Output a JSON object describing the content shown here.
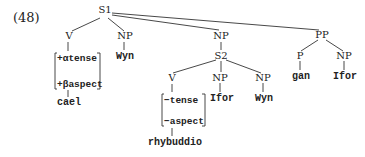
{
  "example_number": "(48)",
  "tree": {
    "root": "S1",
    "s1_children": {
      "v": {
        "label": "V",
        "features": [
          "+αtense",
          "+βaspect"
        ],
        "word": "cael"
      },
      "np1": {
        "label": "NP",
        "word": "Wyn"
      },
      "np2": {
        "label": "NP",
        "s2": {
          "label": "S2",
          "v": {
            "label": "V",
            "features": [
              "−tense",
              "−aspect"
            ],
            "word": "rhybuddio"
          },
          "np_a": {
            "label": "NP",
            "word": "Ifor"
          },
          "np_b": {
            "label": "NP",
            "word": "Wyn"
          }
        }
      },
      "pp": {
        "label": "PP",
        "p": {
          "label": "P",
          "word": "gan"
        },
        "np": {
          "label": "NP",
          "word": "Ifor"
        }
      }
    }
  }
}
